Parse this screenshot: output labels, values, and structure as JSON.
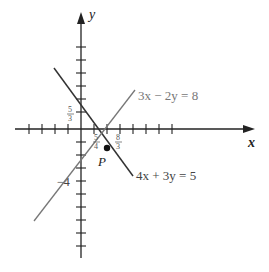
{
  "figure": {
    "x_axis_label": "x",
    "y_axis_label": "y",
    "point_label": "P",
    "line1": {
      "equation": "3x − 2y = 8",
      "color": "#777777"
    },
    "line2": {
      "equation": "4x + 3y = 5",
      "color": "#333333"
    },
    "labels": {
      "y_intercept_line2_num": "5",
      "y_intercept_line2_den": "3",
      "x_intercept_line2_num": "5",
      "x_intercept_line2_den": "4",
      "x_intercept_line1_num": "8",
      "x_intercept_line1_den": "3",
      "y_intercept_line1": "−4"
    }
  }
}
